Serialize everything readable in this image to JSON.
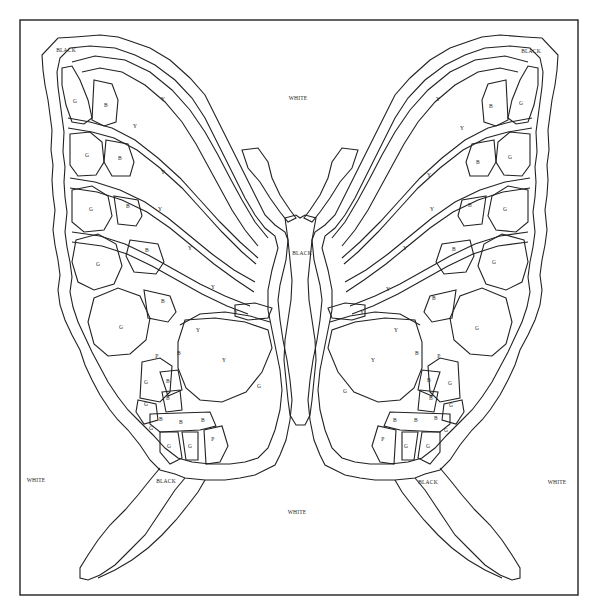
{
  "diagram": {
    "frame": {
      "x": 20,
      "y": 20,
      "w": 558,
      "h": 595
    },
    "colors": {
      "line": "#222222",
      "background": "#ffffff"
    }
  },
  "labels": [
    {
      "text": "BLACK",
      "x": 66,
      "y": 50
    },
    {
      "text": "BLACK",
      "x": 531,
      "y": 51
    },
    {
      "text": "WHITE",
      "x": 298,
      "y": 98
    },
    {
      "text": "BLACK",
      "x": 302,
      "y": 253
    },
    {
      "text": "WHITE",
      "x": 36,
      "y": 480
    },
    {
      "text": "WHITE",
      "x": 557,
      "y": 482
    },
    {
      "text": "BLACK",
      "x": 166,
      "y": 481
    },
    {
      "text": "BLACK",
      "x": 428,
      "y": 482
    },
    {
      "text": "WHITE",
      "x": 297,
      "y": 512
    },
    {
      "text": "G",
      "x": 75,
      "y": 101
    },
    {
      "text": "B",
      "x": 106,
      "y": 105
    },
    {
      "text": "Y",
      "x": 163,
      "y": 99
    },
    {
      "text": "Y",
      "x": 135,
      "y": 126
    },
    {
      "text": "G",
      "x": 87,
      "y": 155
    },
    {
      "text": "B",
      "x": 120,
      "y": 158
    },
    {
      "text": "Y",
      "x": 163,
      "y": 172
    },
    {
      "text": "G",
      "x": 91,
      "y": 209
    },
    {
      "text": "B",
      "x": 128,
      "y": 206
    },
    {
      "text": "Y",
      "x": 160,
      "y": 209
    },
    {
      "text": "G",
      "x": 98,
      "y": 264
    },
    {
      "text": "B",
      "x": 147,
      "y": 250
    },
    {
      "text": "Y",
      "x": 190,
      "y": 248
    },
    {
      "text": "B",
      "x": 163,
      "y": 301
    },
    {
      "text": "Y",
      "x": 213,
      "y": 287
    },
    {
      "text": "G",
      "x": 121,
      "y": 327
    },
    {
      "text": "Y",
      "x": 236,
      "y": 312
    },
    {
      "text": "Y",
      "x": 198,
      "y": 330
    },
    {
      "text": "P",
      "x": 157,
      "y": 356
    },
    {
      "text": "B",
      "x": 179,
      "y": 353
    },
    {
      "text": "Y",
      "x": 224,
      "y": 360
    },
    {
      "text": "G",
      "x": 146,
      "y": 382
    },
    {
      "text": "B",
      "x": 168,
      "y": 381
    },
    {
      "text": "G",
      "x": 146,
      "y": 404
    },
    {
      "text": "B",
      "x": 168,
      "y": 398
    },
    {
      "text": "G",
      "x": 259,
      "y": 386
    },
    {
      "text": "B",
      "x": 161,
      "y": 419
    },
    {
      "text": "B",
      "x": 181,
      "y": 422
    },
    {
      "text": "B",
      "x": 203,
      "y": 420
    },
    {
      "text": "G",
      "x": 151,
      "y": 428
    },
    {
      "text": "G",
      "x": 169,
      "y": 446
    },
    {
      "text": "G",
      "x": 190,
      "y": 446
    },
    {
      "text": "P",
      "x": 213,
      "y": 439
    },
    {
      "text": "Y",
      "x": 438,
      "y": 99
    },
    {
      "text": "B",
      "x": 491,
      "y": 106
    },
    {
      "text": "G",
      "x": 521,
      "y": 103
    },
    {
      "text": "Y",
      "x": 462,
      "y": 128
    },
    {
      "text": "B",
      "x": 478,
      "y": 162
    },
    {
      "text": "G",
      "x": 510,
      "y": 157
    },
    {
      "text": "Y",
      "x": 429,
      "y": 175
    },
    {
      "text": "B",
      "x": 470,
      "y": 205
    },
    {
      "text": "G",
      "x": 505,
      "y": 209
    },
    {
      "text": "Y",
      "x": 432,
      "y": 209
    },
    {
      "text": "B",
      "x": 454,
      "y": 249
    },
    {
      "text": "G",
      "x": 494,
      "y": 262
    },
    {
      "text": "Y",
      "x": 405,
      "y": 248
    },
    {
      "text": "B",
      "x": 434,
      "y": 298
    },
    {
      "text": "Y",
      "x": 388,
      "y": 289
    },
    {
      "text": "Y",
      "x": 362,
      "y": 312
    },
    {
      "text": "G",
      "x": 477,
      "y": 328
    },
    {
      "text": "Y",
      "x": 396,
      "y": 330
    },
    {
      "text": "B",
      "x": 417,
      "y": 353
    },
    {
      "text": "P",
      "x": 439,
      "y": 356
    },
    {
      "text": "Y",
      "x": 373,
      "y": 360
    },
    {
      "text": "B",
      "x": 429,
      "y": 380
    },
    {
      "text": "G",
      "x": 450,
      "y": 383
    },
    {
      "text": "G",
      "x": 345,
      "y": 391
    },
    {
      "text": "B",
      "x": 431,
      "y": 398
    },
    {
      "text": "G",
      "x": 451,
      "y": 405
    },
    {
      "text": "B",
      "x": 395,
      "y": 420
    },
    {
      "text": "B",
      "x": 416,
      "y": 420
    },
    {
      "text": "B",
      "x": 436,
      "y": 418
    },
    {
      "text": "G",
      "x": 446,
      "y": 430
    },
    {
      "text": "P",
      "x": 383,
      "y": 439
    },
    {
      "text": "G",
      "x": 406,
      "y": 446
    },
    {
      "text": "G",
      "x": 428,
      "y": 446
    }
  ]
}
